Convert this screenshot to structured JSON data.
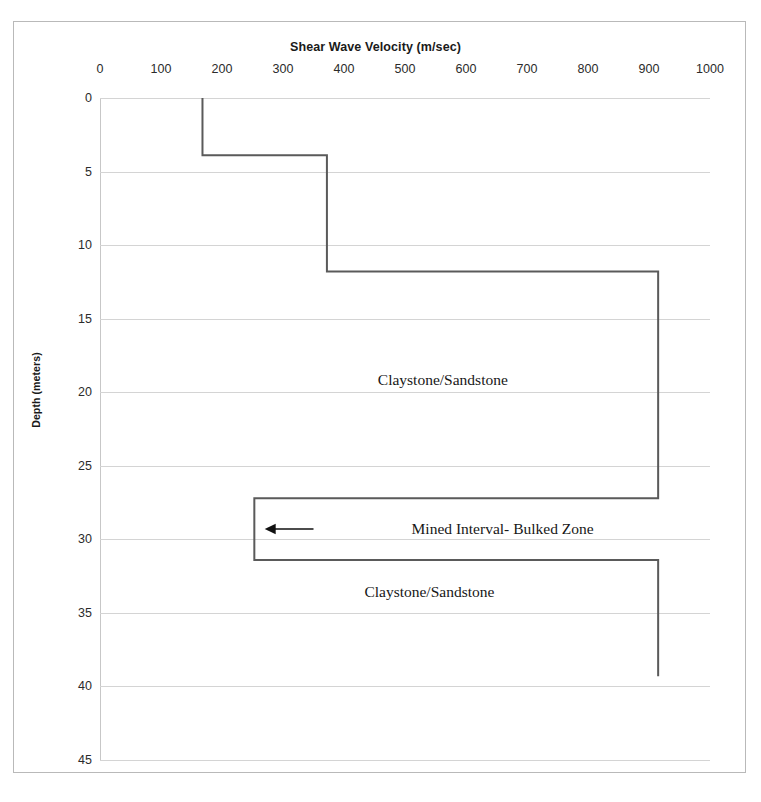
{
  "chart_data": {
    "type": "line",
    "title": "Shear Wave Velocity (m/sec)",
    "xlabel": "Shear Wave Velocity (m/sec)",
    "ylabel": "Depth (meters)",
    "xlim": [
      0,
      1000
    ],
    "ylim": [
      0,
      45
    ],
    "y_inverted": true,
    "grid": "horizontal",
    "legend": "none",
    "xticks": [
      0,
      100,
      200,
      300,
      400,
      500,
      600,
      700,
      800,
      900,
      1000
    ],
    "yticks": [
      0,
      5,
      10,
      15,
      20,
      25,
      30,
      35,
      40,
      45
    ],
    "series": [
      {
        "name": "Shear wave velocity profile",
        "color": "#5a5a5a",
        "line_width": 2,
        "step_style": "vertical-first",
        "points": [
          {
            "velocity": 168,
            "depth": 0.0
          },
          {
            "velocity": 168,
            "depth": 3.9
          },
          {
            "velocity": 372,
            "depth": 3.9
          },
          {
            "velocity": 372,
            "depth": 11.8
          },
          {
            "velocity": 915,
            "depth": 11.8
          },
          {
            "velocity": 915,
            "depth": 27.2
          },
          {
            "velocity": 253,
            "depth": 27.2
          },
          {
            "velocity": 253,
            "depth": 31.4
          },
          {
            "velocity": 915,
            "depth": 31.4
          },
          {
            "velocity": 915,
            "depth": 39.3
          }
        ],
        "layers": [
          {
            "label": "Claystone/Sandstone",
            "velocity": 168,
            "depth_top": 0.0,
            "depth_bottom": 3.9
          },
          {
            "label": "Claystone/Sandstone",
            "velocity": 372,
            "depth_top": 3.9,
            "depth_bottom": 11.8
          },
          {
            "label": "Claystone/Sandstone",
            "velocity": 915,
            "depth_top": 11.8,
            "depth_bottom": 27.2
          },
          {
            "label": "Mined Interval- Bulked Zone",
            "velocity": 253,
            "depth_top": 27.2,
            "depth_bottom": 31.4
          },
          {
            "label": "Claystone/Sandstone",
            "velocity": 915,
            "depth_top": 31.4,
            "depth_bottom": 39.3
          }
        ]
      }
    ],
    "annotations": [
      {
        "id": "claystone-upper",
        "text": "Claystone/Sandstone",
        "velocity": 562,
        "depth": 19.2
      },
      {
        "id": "mined-interval",
        "text": "Mined Interval- Bulked Zone",
        "velocity": 660,
        "depth": 29.3
      },
      {
        "id": "claystone-lower",
        "text": "Claystone/Sandstone",
        "velocity": 540,
        "depth": 33.6
      },
      {
        "id": "mined-interval-arrow",
        "text": "",
        "arrow": "left-arrow",
        "from_velocity": 350,
        "to_velocity": 270,
        "depth": 29.3
      }
    ]
  },
  "colors": {
    "series_line": "#5a5a5a",
    "gridline": "#d4d4d4",
    "frame": "#b9b9b9",
    "text": "#1f1f1f",
    "arrow": "#111111"
  }
}
